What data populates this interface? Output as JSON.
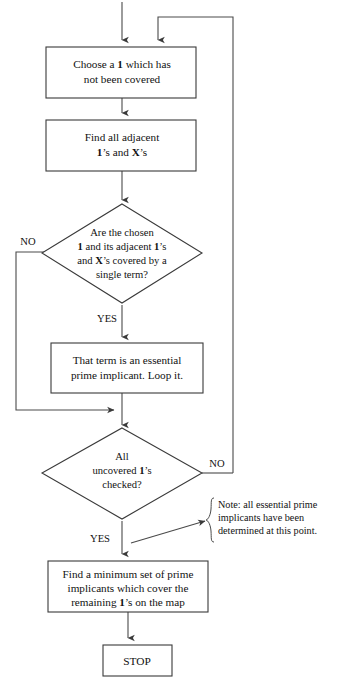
{
  "diagram": {
    "type": "flowchart",
    "colors": {
      "stroke": "#3a3a3a",
      "line": "#4a4a4a",
      "fill": "#ffffff",
      "text": "#111111"
    },
    "nodes": {
      "choose_one": {
        "shape": "process",
        "line1_pre": "Choose a ",
        "line1_bold": "1",
        "line1_post": " which has",
        "line2": "not been covered"
      },
      "find_adjacent": {
        "shape": "process",
        "line1": "Find all adjacent",
        "line2_b1": "1",
        "line2_mid": "’s and ",
        "line2_b2": "X",
        "line2_end": "’s"
      },
      "single_term_decision": {
        "shape": "decision",
        "line1": "Are the chosen",
        "line2_b1": "1",
        "line2_mid": " and its adjacent ",
        "line2_b2": "1",
        "line2_end": "’s",
        "line3_pre": "and ",
        "line3_b": "X",
        "line3_post": "’s covered by a",
        "line4": "single term?"
      },
      "essential_prime": {
        "shape": "process",
        "line1": "That term is an essential",
        "line2": "prime implicant.  Loop it."
      },
      "all_checked_decision": {
        "shape": "decision",
        "line1": "All",
        "line2_pre": "uncovered ",
        "line2_bold": "1",
        "line2_post": "’s",
        "line3": "checked?"
      },
      "minimum_set": {
        "shape": "process",
        "line1": "Find a minimum set of prime",
        "line2": "implicants which cover the",
        "line3_pre": "remaining ",
        "line3_bold": "1",
        "line3_post": "’s on the map"
      },
      "stop": {
        "shape": "terminal",
        "label": "STOP"
      }
    },
    "branch_labels": {
      "decision1_no": "NO",
      "decision1_yes": "YES",
      "decision2_no": "NO",
      "decision2_yes": "YES"
    },
    "note": {
      "line1": "Note:  all essential prime",
      "line2": "implicants have been",
      "line3": "determined at this point."
    }
  }
}
